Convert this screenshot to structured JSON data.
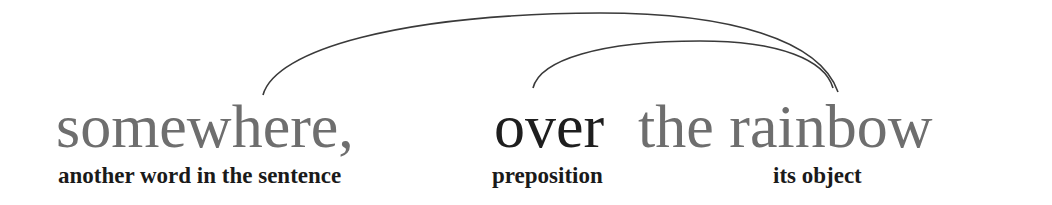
{
  "sentence": {
    "words": [
      {
        "text": "somewhere,",
        "color": "#6e6e6e"
      },
      {
        "text": "over",
        "color": "#1e1e1e"
      },
      {
        "text": "the rainbow",
        "color": "#6e6e6e"
      }
    ]
  },
  "labels": [
    {
      "text": "another word in the sentence"
    },
    {
      "text": "preposition"
    },
    {
      "text": "its object"
    }
  ],
  "arcs": [
    {
      "from": "somewhere,",
      "to": "rainbow",
      "color": "#3a3a3a"
    },
    {
      "from": "over",
      "to": "rainbow",
      "color": "#3a3a3a"
    }
  ]
}
